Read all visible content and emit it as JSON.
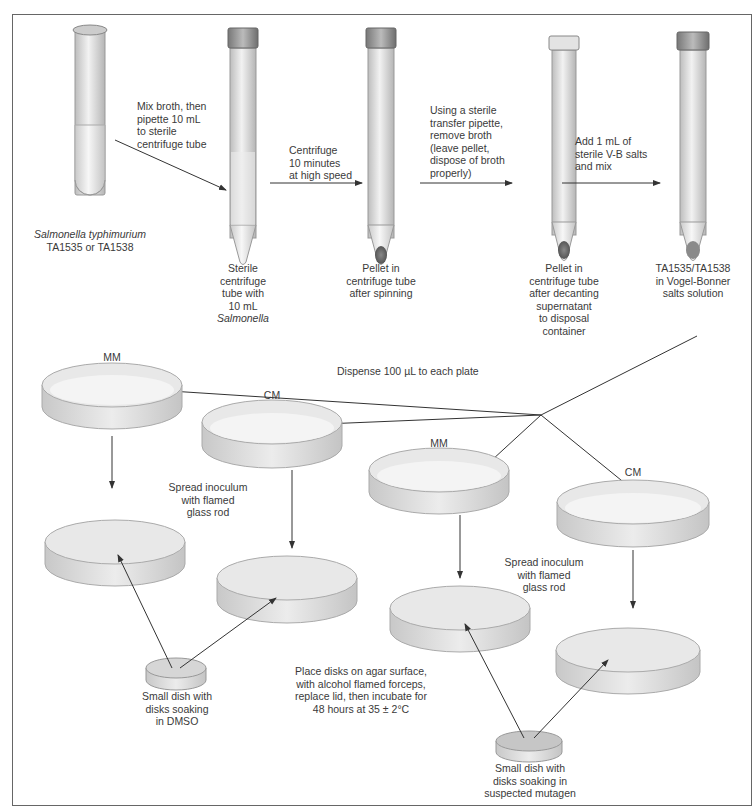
{
  "diagram": {
    "tubes": [
      {
        "id": "culture",
        "caption_italic": "Salmonella typhimurium",
        "caption": "TA1535 or TA1538"
      },
      {
        "id": "sterile",
        "caption": [
          "Sterile",
          "centrifuge",
          "tube with",
          "10 mL"
        ],
        "caption_italic": "Salmonella"
      },
      {
        "id": "pellet",
        "caption": [
          "Pellet in",
          "centrifuge tube",
          "after spinning"
        ]
      },
      {
        "id": "decanted",
        "caption": [
          "Pellet in",
          "centrifuge tube",
          "after decanting",
          "supernatant",
          "to disposal",
          "container"
        ]
      },
      {
        "id": "resuspended",
        "caption": [
          "TA1535/TA1538",
          "in Vogel-Bonner",
          "salts solution"
        ]
      }
    ],
    "steps": [
      [
        "Mix broth, then",
        "pipette 10 mL",
        "to sterile",
        "centrifuge tube"
      ],
      [
        "Centrifuge",
        "10 minutes",
        "at high speed"
      ],
      [
        "Using a sterile",
        "transfer pipette,",
        "remove broth",
        "(leave pellet,",
        "dispose of broth",
        "properly)"
      ],
      [
        "Add 1 mL of",
        "sterile V-B salts",
        "and mix"
      ]
    ],
    "dispense_label": "Dispense 100 µL to each plate",
    "plates": [
      {
        "id": "plate-1",
        "label": "MM"
      },
      {
        "id": "plate-2",
        "label": "CM"
      },
      {
        "id": "plate-3",
        "label": "MM"
      },
      {
        "id": "plate-4",
        "label": "CM"
      }
    ],
    "spread_left": [
      "Spread inoculum",
      "with flamed",
      "glass rod"
    ],
    "spread_right": [
      "Spread inoculum",
      "with flamed",
      "glass rod"
    ],
    "small_dish_left": [
      "Small dish with",
      "disks soaking",
      "in DMSO"
    ],
    "small_dish_right": [
      "Small dish with",
      "disks soaking in",
      "suspected mutagen"
    ],
    "place_disks": [
      "Place disks on agar surface,",
      "with alcohol flamed forceps,",
      "replace lid, then incubate for",
      "48 hours at 35 ± 2°C"
    ]
  }
}
